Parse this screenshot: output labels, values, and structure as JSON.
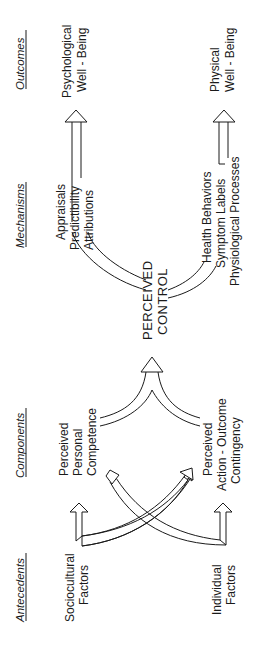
{
  "diagram": {
    "orientation": "rotated-90-ccw",
    "columns": {
      "antecedents": "Antecedents",
      "components": "Components",
      "mechanisms": "Mechanisms",
      "outcomes": "Outcomes"
    },
    "antecedents": {
      "sociocultural": [
        "Sociocultural",
        "Factors"
      ],
      "individual": [
        "Individual",
        "Factors"
      ]
    },
    "components": {
      "competence": [
        "Perceived",
        "Personal",
        "Competence"
      ],
      "contingency": [
        "Perceived",
        "Action - Outcome",
        "Contingency"
      ]
    },
    "center": [
      "PERCEIVED",
      "CONTROL"
    ],
    "mechanisms": {
      "psychological": [
        "Appraisals",
        "Predictibility",
        "Attributions"
      ],
      "physical": [
        "Health Behaviors",
        "Symptom Labels",
        "Physiological Processes"
      ]
    },
    "outcomes": {
      "psychological": [
        "Psychological",
        "Well - Being"
      ],
      "physical": [
        "Physical",
        "Well - Being"
      ]
    }
  }
}
